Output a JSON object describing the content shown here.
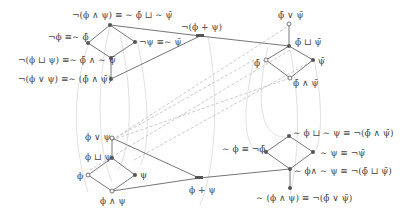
{
  "colors": {
    "edge": "#666666",
    "dashed": "#b8b8b8",
    "curve": "#d4d4d4",
    "node": "#555555",
    "text": "#444444"
  },
  "top_left_lattice": {
    "top": "¬(ϕ ∧ ψ) ≡ ∼ ϕ̄ ⊔ ∼ ψ̄",
    "left": "¬ϕ ≡∼ ϕ̄",
    "right": "¬ψ ≡∼ ψ̄",
    "bottom": "¬(ϕ ⊔ ψ) ≡∼ ϕ̄ ∧ ∼ ψ̄",
    "below": "¬(ϕ ∨ ψ) ≡∼ (ϕ̄ ∧ ψ̄)"
  },
  "top_middle": {
    "node": "¬(ϕ + ψ)"
  },
  "top_right_lattice": {
    "above": "ϕ̄ ∨ ψ̄",
    "top": "ϕ̄ ⊔ ψ̄",
    "left": "ϕ̄",
    "right": "ψ̄",
    "bottom": "ϕ̄ ∧ ψ̄"
  },
  "bottom_left_lattice": {
    "above": "ϕ ∨ ψ",
    "top": "ϕ ⊔ ψ",
    "left": "ϕ",
    "right": "ψ",
    "bottom": "ϕ ∧ ψ"
  },
  "bottom_middle": {
    "node": "ϕ + ψ"
  },
  "bottom_right_lattice": {
    "top": "∼ ϕ ⊔ ∼ ψ ≡ ¬(ϕ̄ ∧ ψ̄)",
    "left": "∼ ϕ ≡ ¬ϕ̄",
    "right": "∼ ψ ≡ ¬ψ̄",
    "bottom": "∼ ϕ∧ ∼ ψ ≡ ¬(ϕ̄ ⊔ ψ̄)",
    "below": "∼ (ϕ ∧ ψ) ≡ ¬(ϕ̄ ∨ ψ̄)"
  }
}
